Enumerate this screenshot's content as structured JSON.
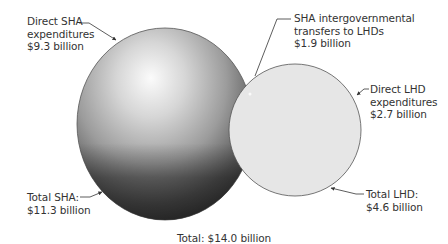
{
  "diagram": {
    "type": "overlapping-circles",
    "colors": {
      "sha_circle_light": "#f4f4f4",
      "sha_circle_mid": "#a8a8a8",
      "sha_circle_dark": "#3c3c3c",
      "lhd_circle_fill": "#e6e6e6",
      "outline": "#555555",
      "text": "#333333"
    },
    "labels": {
      "direct_sha": {
        "line1": "Direct SHA",
        "line2": "expenditures",
        "line3": "$9.3 billion"
      },
      "transfers": {
        "line1": "SHA intergovernmental",
        "line2": "transfers to LHDs",
        "line3": "$1.9 billion"
      },
      "direct_lhd": {
        "line1": "Direct LHD",
        "line2": "expenditures",
        "line3": "$2.7 billion"
      },
      "total_lhd": {
        "line1": "Total LHD:",
        "line2": "$4.6 billion"
      },
      "total_sha": {
        "line1": "Total SHA:",
        "line2": "$11.3 billion"
      },
      "total": "Total: $14.0 billion"
    },
    "values": {
      "direct_sha_billion": 9.3,
      "transfers_billion": 1.9,
      "direct_lhd_billion": 2.7,
      "total_lhd_billion": 4.6,
      "total_sha_billion": 11.3,
      "total_billion": 14.0
    }
  }
}
